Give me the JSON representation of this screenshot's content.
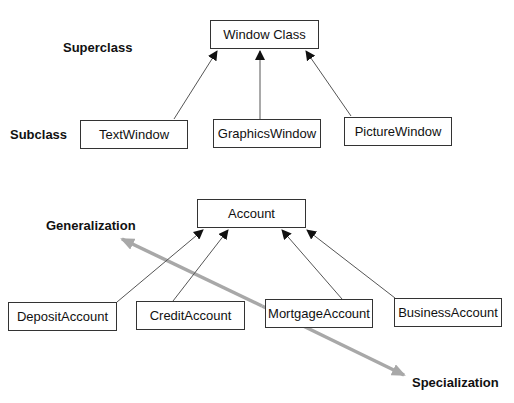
{
  "diagram1": {
    "superclass_label": "Superclass",
    "subclass_label": "Subclass",
    "parent": "Window Class",
    "children": [
      "TextWindow",
      "GraphicsWindow",
      "PictureWindow"
    ]
  },
  "diagram2": {
    "parent": "Account",
    "children": [
      "DepositAccount",
      "CreditAccount",
      "MortgageAccount",
      "BusinessAccount"
    ],
    "generalization_label": "Generalization",
    "specialization_label": "Specialization"
  },
  "colors": {
    "line": "#555555",
    "gray_arrow": "#a8a8a8",
    "box_border": "#333333"
  }
}
